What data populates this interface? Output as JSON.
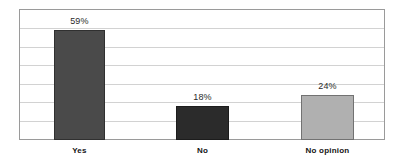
{
  "chart_data": {
    "type": "bar",
    "title": "",
    "subtitle": "",
    "xlabel": "",
    "ylabel": "",
    "categories": [
      "Yes",
      "No",
      "No opinion"
    ],
    "values": [
      59,
      18,
      24
    ],
    "value_labels": [
      "59%",
      "18%",
      "24%"
    ],
    "ylim": [
      0,
      70
    ],
    "y_tick_step": 10,
    "y_tick_labels_visible": false,
    "gridlines": {
      "horizontal": true,
      "vertical": false,
      "count": 6,
      "color": "#d2d2d2"
    },
    "legend": {
      "visible": false,
      "position": "none",
      "entries": []
    },
    "bar_colors": [
      "#4a4a4a",
      "#2b2b2b",
      "#b0b0b0"
    ],
    "plot_border_color": "#9a9a9a",
    "background_color": "#ffffff",
    "annotations": []
  },
  "bars": [
    {
      "category": "Yes",
      "value": 59,
      "value_label": "59%",
      "color": "#4a4a4a",
      "left_pct": 9.56,
      "width_pct": 13.93,
      "height_pct": 84.29
    },
    {
      "category": "No",
      "value": 18,
      "value_label": "18%",
      "color": "#2b2b2b",
      "left_pct": 42.9,
      "width_pct": 14.48,
      "height_pct": 25.71
    },
    {
      "category": "No opinion",
      "value": 24,
      "value_label": "24%",
      "color": "#b0b0b0",
      "left_pct": 77.05,
      "width_pct": 14.48,
      "height_pct": 34.29
    }
  ]
}
